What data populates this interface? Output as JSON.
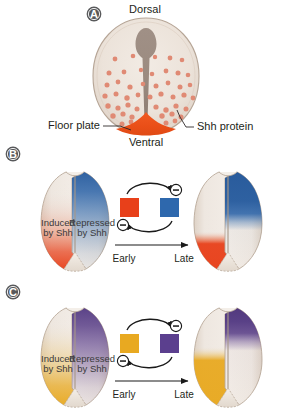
{
  "figure": {
    "background_color": "#ffffff"
  },
  "panels": [
    {
      "id": "A",
      "badge": "A",
      "labels": {
        "dorsal": "Dorsal",
        "ventral": "Ventral",
        "floor_plate": "Floor plate",
        "shh_protein": "Shh protein"
      },
      "colors": {
        "tube_fill": "#ece4dc",
        "tube_outline": "#b9a99a",
        "lumen": "#9d8d83",
        "floor_plate": "#ea5520",
        "shh_dot": "#e08a74"
      }
    },
    {
      "id": "B",
      "badge": "B",
      "labels": {
        "induced": "Induced",
        "induced_line2": "by Shh",
        "repressed": "Repressed",
        "repressed_line2": "by Shh",
        "early": "Early",
        "late": "Late",
        "minus_top": "–",
        "minus_bottom": "–"
      },
      "colors": {
        "induced": "#e8401a",
        "repressed": "#2e68ad",
        "tube_base": "#ece4dc",
        "tube_outline": "#b9a99a"
      }
    },
    {
      "id": "C",
      "badge": "C",
      "labels": {
        "induced": "Induced",
        "induced_line2": "by Shh",
        "repressed": "Repressed",
        "repressed_line2": "by Shh",
        "early": "Early",
        "late": "Late",
        "minus_top": "–",
        "minus_bottom": "–"
      },
      "colors": {
        "induced": "#e8a921",
        "repressed": "#5b3f8e",
        "tube_base": "#ece4dc",
        "tube_outline": "#b9a99a"
      }
    }
  ],
  "shh_dots": [
    {
      "x": 115,
      "y": 59,
      "r": 2.4
    },
    {
      "x": 133,
      "y": 56,
      "r": 2.3
    },
    {
      "x": 155,
      "y": 57,
      "r": 2.2
    },
    {
      "x": 170,
      "y": 58,
      "r": 2.4
    },
    {
      "x": 182,
      "y": 60,
      "r": 2.3
    },
    {
      "x": 109,
      "y": 73,
      "r": 2.5
    },
    {
      "x": 124,
      "y": 72,
      "r": 2.4
    },
    {
      "x": 141,
      "y": 70,
      "r": 2.2
    },
    {
      "x": 152,
      "y": 74,
      "r": 2.3
    },
    {
      "x": 166,
      "y": 71,
      "r": 2.4
    },
    {
      "x": 178,
      "y": 73,
      "r": 2.5
    },
    {
      "x": 188,
      "y": 75,
      "r": 2.3
    },
    {
      "x": 107,
      "y": 85,
      "r": 2.5
    },
    {
      "x": 118,
      "y": 82,
      "r": 2.4
    },
    {
      "x": 130,
      "y": 87,
      "r": 2.6
    },
    {
      "x": 143,
      "y": 84,
      "r": 2.3
    },
    {
      "x": 156,
      "y": 86,
      "r": 2.5
    },
    {
      "x": 168,
      "y": 83,
      "r": 2.4
    },
    {
      "x": 180,
      "y": 87,
      "r": 2.5
    },
    {
      "x": 190,
      "y": 85,
      "r": 2.3
    },
    {
      "x": 105,
      "y": 96,
      "r": 2.6
    },
    {
      "x": 116,
      "y": 94,
      "r": 2.5
    },
    {
      "x": 127,
      "y": 98,
      "r": 2.7
    },
    {
      "x": 138,
      "y": 95,
      "r": 2.4
    },
    {
      "x": 150,
      "y": 97,
      "r": 2.5
    },
    {
      "x": 161,
      "y": 94,
      "r": 2.6
    },
    {
      "x": 173,
      "y": 97,
      "r": 2.5
    },
    {
      "x": 184,
      "y": 95,
      "r": 2.6
    },
    {
      "x": 193,
      "y": 98,
      "r": 2.4
    },
    {
      "x": 108,
      "y": 106,
      "r": 2.7
    },
    {
      "x": 118,
      "y": 108,
      "r": 2.6
    },
    {
      "x": 128,
      "y": 105,
      "r": 2.6
    },
    {
      "x": 137,
      "y": 109,
      "r": 2.5
    },
    {
      "x": 156,
      "y": 107,
      "r": 2.6
    },
    {
      "x": 166,
      "y": 110,
      "r": 2.7
    },
    {
      "x": 176,
      "y": 106,
      "r": 2.6
    },
    {
      "x": 186,
      "y": 109,
      "r": 2.5
    },
    {
      "x": 113,
      "y": 116,
      "r": 2.7
    },
    {
      "x": 123,
      "y": 114,
      "r": 2.6
    },
    {
      "x": 132,
      "y": 117,
      "r": 2.6
    },
    {
      "x": 162,
      "y": 116,
      "r": 2.7
    },
    {
      "x": 172,
      "y": 114,
      "r": 2.6
    },
    {
      "x": 181,
      "y": 117,
      "r": 2.5
    },
    {
      "x": 122,
      "y": 124,
      "r": 2.5
    },
    {
      "x": 131,
      "y": 122,
      "r": 2.4
    },
    {
      "x": 166,
      "y": 123,
      "r": 2.5
    },
    {
      "x": 175,
      "y": 121,
      "r": 2.4
    }
  ]
}
